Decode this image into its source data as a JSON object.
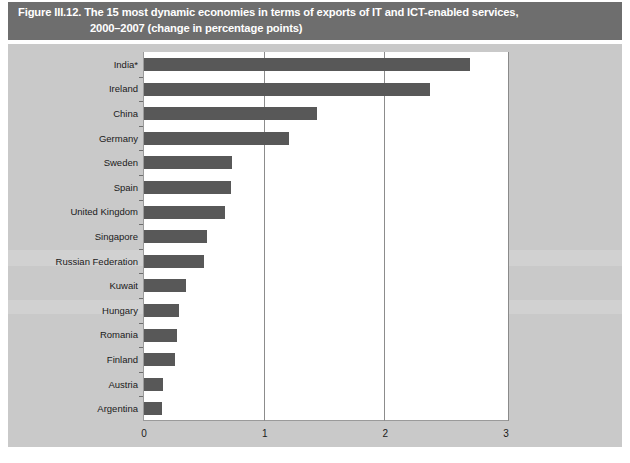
{
  "figure": {
    "title_line1": "Figure III.12. The 15 most dynamic economies in terms of exports of IT and ICT-enabled services,",
    "title_line2": "2000–2007 (change in percentage points)",
    "banner_color": "#6e6e6e",
    "panel_color": "#c9c9c9",
    "bar_color": "#585858",
    "plot_background": "#ffffff"
  },
  "source": {
    "text": ""
  },
  "chart_data": {
    "type": "bar",
    "orientation": "horizontal",
    "title": "Figure III.12. The 15 most dynamic economies in terms of exports of IT and ICT-enabled services, 2000–2007 (change in percentage points)",
    "xlabel": "",
    "ylabel": "",
    "xlim": [
      0,
      3
    ],
    "xticks": [
      0,
      1,
      2,
      3
    ],
    "xtick_labels": [
      "0",
      "1",
      "2",
      "3"
    ],
    "grid": true,
    "gridlines_at": [
      1,
      2
    ],
    "legend": null,
    "series_color": "#585858",
    "categories": [
      "India*",
      "Ireland",
      "China",
      "Germany",
      "Sweden",
      "Spain",
      "United Kingdom",
      "Singapore",
      "Russian Federation",
      "Kuwait",
      "Hungary",
      "Romania",
      "Finland",
      "Austria",
      "Argentina"
    ],
    "values": [
      2.7,
      2.37,
      1.43,
      1.2,
      0.73,
      0.72,
      0.67,
      0.52,
      0.5,
      0.35,
      0.29,
      0.27,
      0.26,
      0.16,
      0.15
    ],
    "note": "India* denotes a footnote marker on the India category label."
  }
}
